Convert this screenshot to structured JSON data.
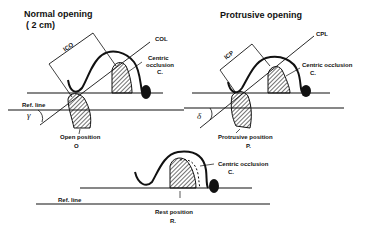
{
  "panels": {
    "normal": {
      "title_line1": "Normal opening",
      "title_line2": "( 2 cm)",
      "line_label": "COL",
      "distance_label": "lCO",
      "centric_label_1": "Centric",
      "centric_label_2": "occlusion",
      "centric_label_3": "C.",
      "ref_label": "Ref. line",
      "angle_label": "γ",
      "position_label": "Open position",
      "position_letter": "O"
    },
    "protrusive": {
      "title": "Protrusive opening",
      "line_label": "CPL",
      "distance_label": "lCP",
      "centric_label": "Centric occlusion",
      "centric_letter": "C.",
      "angle_label": "δ",
      "position_label": "Protrusive position",
      "position_letter": "P."
    },
    "rest": {
      "centric_label": "Centric occlusion",
      "centric_letter": "C.",
      "ref_label": "Ref. line",
      "position_label": "Rest position",
      "position_letter": "R."
    }
  },
  "colors": {
    "ink": "#111111",
    "background": "#ffffff"
  }
}
